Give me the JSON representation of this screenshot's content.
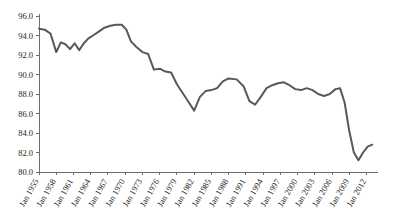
{
  "chart_data": {
    "type": "line",
    "title": "",
    "subtitle": "",
    "xlabel": "",
    "ylabel": "",
    "ylim": [
      80.0,
      96.0
    ],
    "ytick_step": 2.0,
    "yticks": [
      "96.0",
      "94.0",
      "92.0",
      "90.0",
      "88.0",
      "86.0",
      "84.0",
      "82.0",
      "80.0"
    ],
    "ytick_values": [
      96.0,
      94.0,
      92.0,
      90.0,
      88.0,
      86.0,
      84.0,
      82.0,
      80.0
    ],
    "xticks": [
      "Jan 1955",
      "Jan 1958",
      "Jan 1961",
      "Jan 1964",
      "Jan 1967",
      "Jan 1970",
      "Jan 1973",
      "Jan 1976",
      "Jan 1979",
      "Jan 1982",
      "Jan 1985",
      "Jan 1988",
      "Jan 1991",
      "Jan 1994",
      "Jan 1997",
      "Jan 2000",
      "Jan 2003",
      "Jan 2006",
      "Jan 2009",
      "Jan 2012"
    ],
    "xtick_year_start": 1955,
    "xtick_year_end": 2012,
    "xtick_year_step": 3,
    "xlim_years": [
      1955,
      2014
    ],
    "grid": false,
    "legend": "none",
    "line_color": "#595959",
    "axis_color": "#6e6e6e",
    "text_color": "#231f20",
    "background": "#ffffff",
    "series": [
      {
        "name": "rate",
        "x": [
          1955.0,
          1956.0,
          1957.0,
          1958.0,
          1958.8,
          1959.6,
          1960.4,
          1961.2,
          1962.0,
          1962.8,
          1963.6,
          1964.4,
          1965.4,
          1966.4,
          1967.4,
          1968.4,
          1969.4,
          1970.2,
          1971.0,
          1972.0,
          1973.0,
          1974.0,
          1975.0,
          1976.0,
          1977.0,
          1978.0,
          1979.0,
          1980.0,
          1981.0,
          1982.0,
          1983.0,
          1984.0,
          1985.0,
          1986.0,
          1987.0,
          1988.0,
          1989.4,
          1990.6,
          1991.6,
          1992.6,
          1993.6,
          1994.6,
          1995.6,
          1996.6,
          1997.6,
          1998.6,
          1999.6,
          2000.6,
          2001.6,
          2002.6,
          2003.6,
          2004.6,
          2005.6,
          2006.6,
          2007.4,
          2008.2,
          2009.0,
          2009.8,
          2010.6,
          2011.4,
          2012.2,
          2013.0
        ],
        "y": [
          94.7,
          94.6,
          94.2,
          92.3,
          93.3,
          93.1,
          92.6,
          93.2,
          92.5,
          93.2,
          93.7,
          94.0,
          94.4,
          94.8,
          95.0,
          95.1,
          95.1,
          94.6,
          93.4,
          92.8,
          92.3,
          92.1,
          90.5,
          90.6,
          90.3,
          90.2,
          89.0,
          88.1,
          87.2,
          86.3,
          87.7,
          88.3,
          88.4,
          88.6,
          89.3,
          89.6,
          89.5,
          88.8,
          87.3,
          86.9,
          87.7,
          88.6,
          88.9,
          89.1,
          89.2,
          88.9,
          88.5,
          88.4,
          88.6,
          88.4,
          88.0,
          87.8,
          88.0,
          88.5,
          88.6,
          87.1,
          84.2,
          82.0,
          81.2,
          82.0,
          82.6,
          82.8
        ]
      }
    ]
  }
}
